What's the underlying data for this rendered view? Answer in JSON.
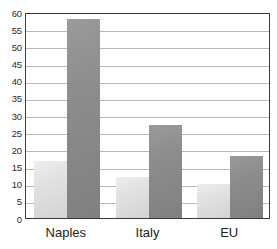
{
  "chart_data": {
    "type": "bar",
    "title": "",
    "title_fragment": "",
    "xlabel": "",
    "ylabel": "",
    "categories": [
      "Naples",
      "Italy",
      "EU"
    ],
    "series": [
      {
        "name": "series-1-light",
        "color": "#dcdcdc",
        "values": [
          16.5,
          12,
          10
        ]
      },
      {
        "name": "series-2-dark",
        "color": "#8a8a8a",
        "values": [
          58,
          27,
          18
        ]
      }
    ],
    "ylim": [
      0,
      60
    ],
    "y_tick_step": 5,
    "y_ticks": [
      0,
      5,
      10,
      15,
      20,
      25,
      30,
      35,
      40,
      45,
      50,
      55,
      60
    ],
    "y_tick_labels": [
      "0",
      "5",
      "10",
      "15",
      "20",
      "25",
      "30",
      "35",
      "40",
      "45",
      "50",
      "55",
      "60"
    ],
    "grid": true,
    "grid_axis": "y",
    "legend": false,
    "legend_position": "none",
    "frame": true,
    "bar_count_per_group": 2
  },
  "style": {
    "gridline_color": "#b8b8b8",
    "frame_color": "#3a3a3a",
    "background": "#ffffff",
    "tick_label_color": "#2b2b2b",
    "category_label_color": "#222222"
  }
}
